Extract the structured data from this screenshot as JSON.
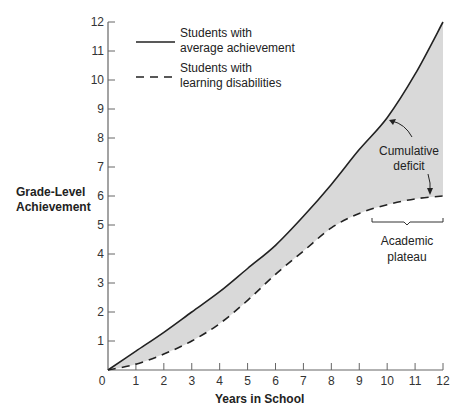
{
  "chart_data": {
    "type": "line",
    "title": "",
    "xlabel": "Years in School",
    "ylabel": "Grade-Level Achievement",
    "xlim": [
      0,
      12
    ],
    "ylim": [
      0,
      12
    ],
    "x_ticks": [
      0,
      1,
      2,
      3,
      4,
      5,
      6,
      7,
      8,
      9,
      10,
      11,
      12
    ],
    "y_ticks": [
      1,
      2,
      3,
      4,
      5,
      6,
      7,
      8,
      9,
      10,
      11,
      12
    ],
    "grid": false,
    "legend_position": "upper-left",
    "x": [
      0,
      1,
      2,
      3,
      4,
      5,
      6,
      7,
      8,
      9,
      10,
      11,
      12
    ],
    "series": [
      {
        "name": "Students with average achievement",
        "style": "solid",
        "values": [
          0,
          0.65,
          1.3,
          2.0,
          2.7,
          3.5,
          4.3,
          5.3,
          6.4,
          7.6,
          8.7,
          10.2,
          12
        ]
      },
      {
        "name": "Students with learning disabilities",
        "style": "dashed",
        "values": [
          0,
          0.2,
          0.55,
          1.0,
          1.6,
          2.4,
          3.3,
          4.1,
          4.9,
          5.4,
          5.7,
          5.9,
          6.0
        ]
      }
    ],
    "fill_between": {
      "color": "#d9d9d9",
      "label": "Cumulative deficit"
    },
    "annotations": [
      {
        "text": "Cumulative deficit",
        "arrows_to": [
          "Students with average achievement at year ~10",
          "Students with learning disabilities at year ~12"
        ]
      },
      {
        "text": "Academic plateau",
        "bracket_span_years": [
          9.5,
          12
        ]
      }
    ]
  },
  "legend": {
    "solid_line_1": "Students with",
    "solid_line_2": "average achievement",
    "dashed_line_1": "Students with",
    "dashed_line_2": "learning disabilities"
  },
  "axes": {
    "ylabel_1": "Grade-Level",
    "ylabel_2": "Achievement",
    "xlabel": "Years in School",
    "x_ticks": [
      "0",
      "1",
      "2",
      "3",
      "4",
      "5",
      "6",
      "7",
      "8",
      "9",
      "10",
      "11",
      "12"
    ],
    "y_ticks": [
      "1",
      "2",
      "3",
      "4",
      "5",
      "6",
      "7",
      "8",
      "9",
      "10",
      "11",
      "12"
    ]
  },
  "annotations": {
    "deficit_1": "Cumulative",
    "deficit_2": "deficit",
    "plateau_1": "Academic",
    "plateau_2": "plateau"
  }
}
